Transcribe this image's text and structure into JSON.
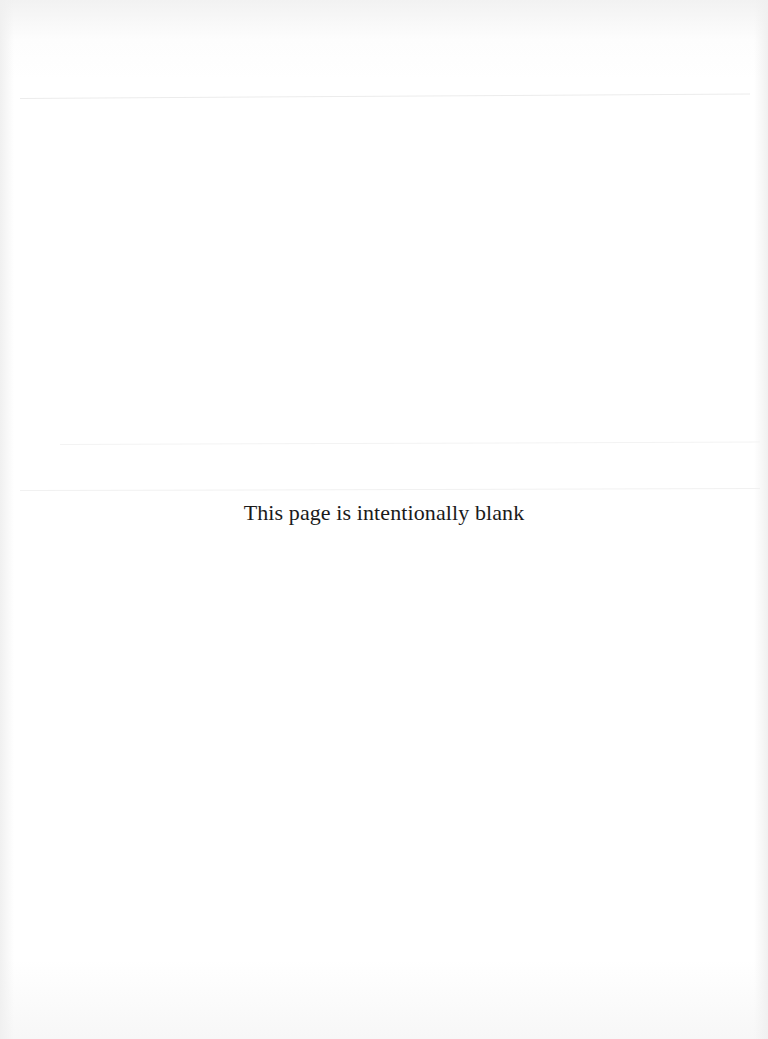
{
  "document": {
    "notice": "This page is intentionally blank"
  }
}
